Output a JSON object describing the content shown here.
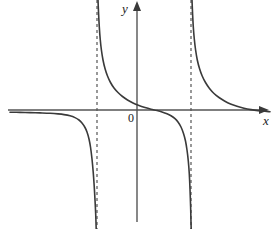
{
  "figure": {
    "title": "",
    "background_color": "#ffffff",
    "curve_color": "#3a3a3a",
    "axis_color": "#555555",
    "asymptote_color": "#555555"
  },
  "labels": {
    "y_axis": "y",
    "x_axis": "x",
    "origin": "0"
  },
  "chart_data": {
    "type": "line",
    "title": "",
    "xlabel": "x",
    "ylabel": "y",
    "grid": false,
    "legend_position": "none",
    "axes": {
      "x_axis_pixel_y": 110,
      "y_axis_pixel_x": 137,
      "x_arrow_tip_pixel_x": 266,
      "y_arrow_tip_pixel_y": 4
    },
    "asymptotes": {
      "vertical_pixel_x": [
        97,
        191
      ],
      "horizontal_pixel_y": 113,
      "vertical_style": "dashed",
      "horizontal_style": "none"
    },
    "branches": [
      {
        "name": "left-branch",
        "x_range_pixels": [
          10,
          97
        ],
        "behavior": "approaches horizontal asymptote from below as x decreases; falls to minus infinity approaching left vertical asymptote",
        "points": [
          [
            10,
            112.2
          ],
          [
            20,
            112.4
          ],
          [
            30,
            112.6
          ],
          [
            40,
            112.9
          ],
          [
            50,
            113.3
          ],
          [
            58,
            113.9
          ],
          [
            64,
            114.6
          ],
          [
            70,
            115.8
          ],
          [
            75,
            117.6
          ],
          [
            79,
            120.0
          ],
          [
            82,
            123.0
          ],
          [
            85,
            127.5
          ],
          [
            87,
            132.0
          ],
          [
            89,
            139.0
          ],
          [
            90.5,
            147.0
          ],
          [
            92,
            159.0
          ],
          [
            93.2,
            172.0
          ],
          [
            94.2,
            186.0
          ],
          [
            95.0,
            200.0
          ],
          [
            95.7,
            214.0
          ],
          [
            96.2,
            229.0
          ]
        ]
      },
      {
        "name": "middle-branch",
        "x_range_pixels": [
          97,
          191
        ],
        "behavior": "descends from plus infinity at left vertical asymptote, crosses x-axis near x-pixel 158, falls to minus infinity at right vertical asymptote",
        "zero_crossing_pixel_x": 158,
        "points": [
          [
            98.0,
            0.0
          ],
          [
            98.6,
            14.0
          ],
          [
            99.3,
            27.0
          ],
          [
            100.2,
            39.0
          ],
          [
            101.4,
            50.0
          ],
          [
            103.0,
            60.0
          ],
          [
            105.0,
            68.5
          ],
          [
            107.5,
            76.0
          ],
          [
            110.5,
            82.5
          ],
          [
            114.0,
            88.0
          ],
          [
            118.0,
            92.5
          ],
          [
            122.5,
            96.5
          ],
          [
            127.5,
            100.0
          ],
          [
            133.0,
            103.0
          ],
          [
            139.0,
            105.5
          ],
          [
            145.0,
            107.5
          ],
          [
            151.0,
            109.2
          ],
          [
            157.0,
            110.6
          ],
          [
            162.0,
            112.0
          ],
          [
            167.0,
            113.8
          ],
          [
            171.0,
            115.8
          ],
          [
            175.0,
            118.6
          ],
          [
            178.0,
            122.0
          ],
          [
            181.0,
            127.0
          ],
          [
            183.5,
            133.5
          ],
          [
            185.5,
            141.0
          ],
          [
            187.0,
            150.0
          ],
          [
            188.3,
            161.0
          ],
          [
            189.3,
            174.0
          ],
          [
            190.0,
            189.0
          ],
          [
            190.6,
            206.0
          ],
          [
            191.0,
            222.0
          ],
          [
            191.2,
            229.0
          ]
        ]
      },
      {
        "name": "right-branch",
        "x_range_pixels": [
          191,
          268
        ],
        "behavior": "descends from plus infinity at right vertical asymptote, approaches horizontal asymptote from above as x increases",
        "points": [
          [
            192.0,
            0.0
          ],
          [
            192.6,
            14.0
          ],
          [
            193.3,
            27.0
          ],
          [
            194.3,
            39.0
          ],
          [
            195.6,
            50.0
          ],
          [
            197.3,
            60.0
          ],
          [
            199.5,
            68.5
          ],
          [
            202.2,
            76.0
          ],
          [
            205.5,
            82.5
          ],
          [
            209.5,
            88.5
          ],
          [
            214.0,
            93.5
          ],
          [
            219.0,
            97.5
          ],
          [
            224.5,
            101.0
          ],
          [
            230.5,
            104.0
          ],
          [
            237.0,
            106.3
          ],
          [
            244.0,
            108.2
          ],
          [
            251.0,
            109.6
          ],
          [
            258.0,
            110.6
          ],
          [
            265.0,
            111.3
          ],
          [
            270.0,
            111.7
          ]
        ]
      }
    ]
  }
}
